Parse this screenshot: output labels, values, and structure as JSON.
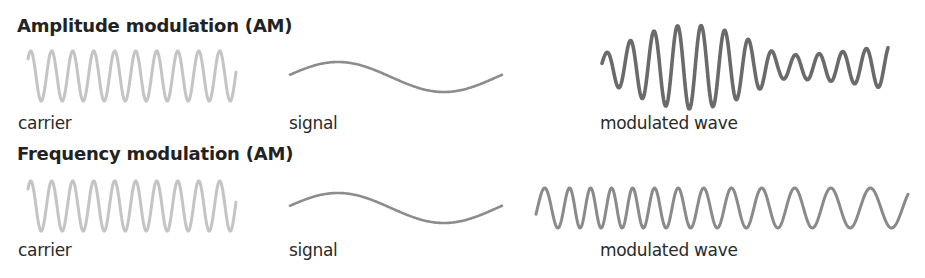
{
  "colors": {
    "carrier": "#c4c4c4",
    "signal": "#8c8c8c",
    "am_wave": "#6a6a6a",
    "fm_wave": "#8a8a8a",
    "text": "#222222"
  },
  "sections": [
    {
      "title": "Amplitude modulation (AM)",
      "labels": {
        "carrier": "carrier",
        "signal": "signal",
        "modulated": "modulated wave"
      }
    },
    {
      "title": "Frequency modulation (AM)",
      "labels": {
        "carrier": "carrier",
        "signal": "signal",
        "modulated": "modulated wave"
      }
    }
  ]
}
